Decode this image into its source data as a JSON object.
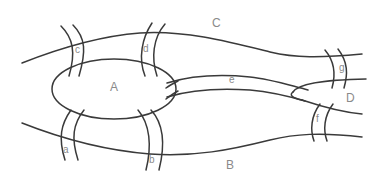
{
  "diagram": {
    "type": "konigsberg-bridges-map",
    "colors": {
      "line": "#3a3a3a",
      "label": "#8a8a8a",
      "background": "#ffffff"
    },
    "regions": [
      {
        "id": "A",
        "label": "A"
      },
      {
        "id": "B",
        "label": "B"
      },
      {
        "id": "C",
        "label": "C"
      },
      {
        "id": "D",
        "label": "D"
      }
    ],
    "bridges": [
      {
        "id": "a",
        "label": "a",
        "connects": [
          "A",
          "B"
        ]
      },
      {
        "id": "b",
        "label": "b",
        "connects": [
          "A",
          "B"
        ]
      },
      {
        "id": "c",
        "label": "c",
        "connects": [
          "A",
          "C"
        ]
      },
      {
        "id": "d",
        "label": "d",
        "connects": [
          "A",
          "C"
        ]
      },
      {
        "id": "e",
        "label": "e",
        "connects": [
          "A",
          "D"
        ]
      },
      {
        "id": "f",
        "label": "f",
        "connects": [
          "B",
          "D"
        ]
      },
      {
        "id": "g",
        "label": "g",
        "connects": [
          "C",
          "D"
        ]
      }
    ]
  }
}
